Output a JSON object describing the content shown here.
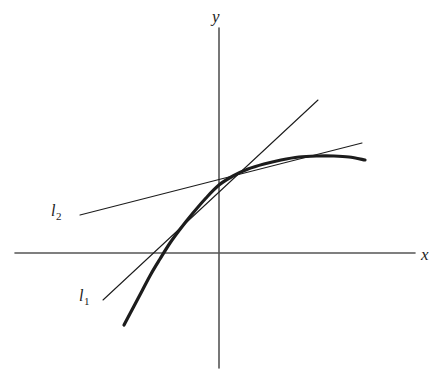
{
  "figure": {
    "background_color": "#ffffff",
    "ink_color": "#1c1c1c",
    "axis_color": "#555555",
    "width": 440,
    "height": 374
  },
  "axes": {
    "x_label": "x",
    "y_label": "y",
    "origin_x": 219,
    "origin_y": 253,
    "x_axis_start_x": 15,
    "x_axis_end_x": 415,
    "y_axis_start_y": 28,
    "y_axis_end_y": 368,
    "grid": "off",
    "ticks": "none"
  },
  "labels": {
    "line1": {
      "base": "l",
      "subscript": "1"
    },
    "line2": {
      "base": "l",
      "subscript": "2"
    }
  },
  "chart_data": {
    "type": "line",
    "title": "",
    "xlabel": "x",
    "ylabel": "y",
    "grid": false,
    "legend": "none",
    "annotations": [
      "l1",
      "l2",
      "x",
      "y"
    ],
    "series": [
      {
        "name": "curve",
        "role": "function-graph",
        "stroke_width": 3.2,
        "points_px": [
          [
            124,
            325
          ],
          [
            133,
            308
          ],
          [
            142,
            291
          ],
          [
            151,
            274
          ],
          [
            160,
            259
          ],
          [
            170,
            243
          ],
          [
            181,
            228
          ],
          [
            193,
            213
          ],
          [
            206,
            198
          ],
          [
            219,
            185
          ],
          [
            233,
            176
          ],
          [
            248,
            169
          ],
          [
            264,
            164
          ],
          [
            281,
            160
          ],
          [
            299,
            157
          ],
          [
            317,
            156
          ],
          [
            334,
            156
          ],
          [
            349,
            157
          ],
          [
            365,
            160
          ]
        ]
      },
      {
        "name": "l1",
        "role": "tangent-line-lower",
        "stroke_width": 1.1,
        "x1": 103,
        "y1": 300,
        "x2": 318,
        "y2": 100,
        "tangent_point_px": [
          158,
          248
        ]
      },
      {
        "name": "l2",
        "role": "tangent-line-upper",
        "stroke_width": 1.1,
        "x1": 80,
        "y1": 215,
        "x2": 362,
        "y2": 143,
        "tangent_point_px": [
          268,
          163
        ]
      }
    ]
  }
}
